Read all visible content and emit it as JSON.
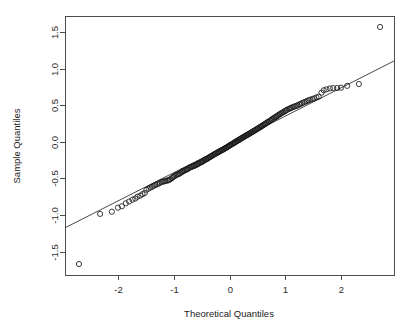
{
  "figure": {
    "background_color": "#ffffff",
    "foreground_color": "#1a1a1a",
    "width": 413,
    "height": 333
  },
  "chart_data": {
    "type": "scatter",
    "title": "",
    "subtitle": "",
    "xlabel": "Theoretical Quantiles",
    "ylabel": "Sample Quantiles",
    "xlim": [
      -2.95,
      2.95
    ],
    "ylim": [
      -1.82,
      1.72
    ],
    "xticks": [
      -2,
      -1,
      0,
      1,
      2
    ],
    "xticklabels": [
      "-2",
      "-1",
      "0",
      "1",
      "2"
    ],
    "yticks": [
      -1.5,
      -1.0,
      -0.5,
      0.0,
      0.5,
      1.0,
      1.5
    ],
    "yticklabels": [
      "-1.5",
      "-1.0",
      "-0.5",
      "0.0",
      "0.5",
      "1.0",
      "1.5"
    ],
    "grid": false,
    "legend": null,
    "box_frame": true,
    "marker": "open-circle",
    "marker_radius_px": 2.6,
    "reference_line": {
      "name": "qq-line",
      "x_start": -2.95,
      "y_start": -1.175,
      "x_end": 2.95,
      "y_end": 1.105,
      "slope": 0.3864,
      "intercept": -0.035
    },
    "x": [
      -2.7,
      -2.32,
      -2.11,
      -2.0,
      -1.93,
      -1.86,
      -1.8,
      -1.74,
      -1.69,
      -1.65,
      -1.6,
      -1.56,
      -1.52,
      -1.49,
      -1.45,
      -1.42,
      -1.39,
      -1.36,
      -1.33,
      -1.3,
      -1.27,
      -1.25,
      -1.22,
      -1.2,
      -1.17,
      -1.15,
      -1.12,
      -1.1,
      -1.08,
      -1.06,
      -1.03,
      -1.01,
      -0.99,
      -0.97,
      -0.95,
      -0.93,
      -0.91,
      -0.89,
      -0.87,
      -0.85,
      -0.84,
      -0.82,
      -0.8,
      -0.78,
      -0.76,
      -0.75,
      -0.73,
      -0.71,
      -0.69,
      -0.68,
      -0.66,
      -0.64,
      -0.63,
      -0.61,
      -0.59,
      -0.58,
      -0.56,
      -0.55,
      -0.53,
      -0.51,
      -0.5,
      -0.48,
      -0.47,
      -0.45,
      -0.44,
      -0.42,
      -0.41,
      -0.39,
      -0.38,
      -0.36,
      -0.35,
      -0.33,
      -0.32,
      -0.3,
      -0.29,
      -0.27,
      -0.26,
      -0.24,
      -0.23,
      -0.21,
      -0.2,
      -0.19,
      -0.17,
      -0.16,
      -0.14,
      -0.13,
      -0.11,
      -0.1,
      -0.09,
      -0.07,
      -0.06,
      -0.04,
      -0.03,
      -0.01,
      0.0,
      0.01,
      0.03,
      0.04,
      0.06,
      0.07,
      0.09,
      0.1,
      0.11,
      0.13,
      0.14,
      0.16,
      0.17,
      0.19,
      0.2,
      0.21,
      0.23,
      0.24,
      0.26,
      0.27,
      0.29,
      0.3,
      0.32,
      0.33,
      0.35,
      0.36,
      0.38,
      0.39,
      0.41,
      0.42,
      0.44,
      0.45,
      0.47,
      0.48,
      0.5,
      0.51,
      0.53,
      0.55,
      0.56,
      0.58,
      0.59,
      0.61,
      0.63,
      0.64,
      0.66,
      0.68,
      0.69,
      0.71,
      0.73,
      0.75,
      0.76,
      0.78,
      0.8,
      0.82,
      0.84,
      0.85,
      0.87,
      0.89,
      0.91,
      0.93,
      0.95,
      0.97,
      0.99,
      1.01,
      1.03,
      1.06,
      1.08,
      1.1,
      1.12,
      1.15,
      1.17,
      1.2,
      1.22,
      1.25,
      1.27,
      1.3,
      1.33,
      1.36,
      1.39,
      1.42,
      1.45,
      1.49,
      1.52,
      1.56,
      1.6,
      1.65,
      1.69,
      1.74,
      1.8,
      1.86,
      1.93,
      2.0,
      2.11,
      2.32,
      2.7
    ],
    "y": [
      -1.67,
      -0.985,
      -0.955,
      -0.9,
      -0.88,
      -0.84,
      -0.815,
      -0.79,
      -0.775,
      -0.75,
      -0.735,
      -0.715,
      -0.7,
      -0.655,
      -0.64,
      -0.625,
      -0.615,
      -0.6,
      -0.59,
      -0.58,
      -0.57,
      -0.56,
      -0.55,
      -0.545,
      -0.54,
      -0.535,
      -0.53,
      -0.525,
      -0.52,
      -0.51,
      -0.495,
      -0.48,
      -0.47,
      -0.46,
      -0.45,
      -0.445,
      -0.44,
      -0.43,
      -0.42,
      -0.41,
      -0.4,
      -0.395,
      -0.39,
      -0.38,
      -0.375,
      -0.37,
      -0.36,
      -0.35,
      -0.345,
      -0.34,
      -0.335,
      -0.33,
      -0.325,
      -0.32,
      -0.312,
      -0.305,
      -0.3,
      -0.292,
      -0.285,
      -0.28,
      -0.275,
      -0.268,
      -0.26,
      -0.252,
      -0.245,
      -0.24,
      -0.235,
      -0.228,
      -0.22,
      -0.212,
      -0.205,
      -0.198,
      -0.192,
      -0.185,
      -0.178,
      -0.17,
      -0.165,
      -0.158,
      -0.152,
      -0.145,
      -0.14,
      -0.135,
      -0.128,
      -0.122,
      -0.115,
      -0.11,
      -0.105,
      -0.098,
      -0.092,
      -0.085,
      -0.08,
      -0.072,
      -0.065,
      -0.058,
      -0.05,
      -0.045,
      -0.038,
      -0.032,
      -0.025,
      -0.018,
      -0.012,
      -0.005,
      0.002,
      0.008,
      0.015,
      0.022,
      0.028,
      0.035,
      0.042,
      0.048,
      0.055,
      0.06,
      0.068,
      0.075,
      0.082,
      0.088,
      0.095,
      0.1,
      0.108,
      0.115,
      0.122,
      0.128,
      0.135,
      0.142,
      0.15,
      0.155,
      0.162,
      0.17,
      0.178,
      0.185,
      0.192,
      0.2,
      0.208,
      0.215,
      0.222,
      0.23,
      0.24,
      0.248,
      0.255,
      0.265,
      0.272,
      0.28,
      0.29,
      0.298,
      0.308,
      0.318,
      0.328,
      0.335,
      0.345,
      0.352,
      0.362,
      0.372,
      0.382,
      0.392,
      0.4,
      0.408,
      0.418,
      0.428,
      0.438,
      0.448,
      0.455,
      0.462,
      0.47,
      0.478,
      0.485,
      0.492,
      0.5,
      0.508,
      0.518,
      0.528,
      0.538,
      0.548,
      0.558,
      0.568,
      0.578,
      0.585,
      0.595,
      0.608,
      0.618,
      0.672,
      0.705,
      0.718,
      0.73,
      0.735,
      0.735,
      0.74,
      0.765,
      0.79,
      1.57
    ]
  },
  "layout": {
    "plot_box": {
      "left": 65,
      "top": 16,
      "right": 394,
      "bottom": 275
    },
    "xlabel_pos": {
      "x": 229,
      "y": 317
    },
    "ylabel_pos": {
      "x": 16,
      "y": 146
    }
  }
}
